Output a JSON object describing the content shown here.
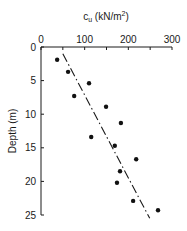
{
  "chart_data": {
    "type": "scatter",
    "title": "",
    "xlabel": "c_u (kN/m²)",
    "xlabel_main": "c",
    "xlabel_sub": "u",
    "xlabel_units": " (kN/m",
    "xlabel_sup": "2",
    "xlabel_close": ")",
    "ylabel": "Depth (m)",
    "xlim": [
      0,
      300
    ],
    "ylim": [
      0,
      25
    ],
    "y_inverted": true,
    "x_axis_position": "top",
    "x_ticks": [
      0,
      100,
      200,
      300
    ],
    "x_minor_ticks": [
      50,
      150,
      250
    ],
    "y_ticks": [
      0,
      5,
      10,
      15,
      20,
      25
    ],
    "grid": false,
    "legend": null,
    "series": [
      {
        "name": "Measured c_u",
        "marker": "filled-circle",
        "points": [
          {
            "cu": 37,
            "depth": 1.9
          },
          {
            "cu": 62,
            "depth": 3.7
          },
          {
            "cu": 110,
            "depth": 5.4
          },
          {
            "cu": 76,
            "depth": 7.3
          },
          {
            "cu": 149,
            "depth": 8.9
          },
          {
            "cu": 183,
            "depth": 11.3
          },
          {
            "cu": 115,
            "depth": 13.4
          },
          {
            "cu": 169,
            "depth": 14.7
          },
          {
            "cu": 218,
            "depth": 16.7
          },
          {
            "cu": 181,
            "depth": 18.5
          },
          {
            "cu": 174,
            "depth": 20.2
          },
          {
            "cu": 211,
            "depth": 22.9
          },
          {
            "cu": 268,
            "depth": 24.3
          }
        ]
      },
      {
        "name": "Trend line",
        "style": "dash-dot",
        "points": [
          {
            "cu": 50,
            "depth": 1.0
          },
          {
            "cu": 249,
            "depth": 25.5
          }
        ]
      }
    ]
  }
}
